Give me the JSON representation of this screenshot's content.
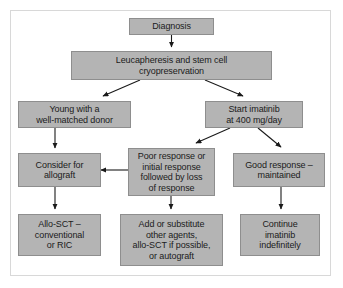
{
  "figure": {
    "type": "flowchart",
    "background_color": "#ffffff",
    "frame_color": "#d8d8d8",
    "node_fill": "#b4b4b4",
    "node_border": "#8e8e8e",
    "edge_color": "#1a1a1a",
    "text_color": "#1b1b1b"
  },
  "nodes": [
    {
      "id": "diagnosis",
      "label": "Diagnosis"
    },
    {
      "id": "leucapheresis",
      "label": "Leucapheresis and stem cell\ncryopreservation"
    },
    {
      "id": "young-donor",
      "label": "Young with a\nwell-matched donor"
    },
    {
      "id": "start-imatinib",
      "label": "Start imatinib\nat 400 mg/day"
    },
    {
      "id": "consider-allograft",
      "label": "Consider for\nallograft"
    },
    {
      "id": "poor-response",
      "label": "Poor response or\ninitial response\nfollowed by loss\nof response"
    },
    {
      "id": "good-response",
      "label": "Good response –\nmaintained"
    },
    {
      "id": "allo-sct",
      "label": "Allo-SCT –\nconventional\nor RIC"
    },
    {
      "id": "add-substitute",
      "label": "Add or substitute\nother agents,\nallo-SCT if possible,\nor autograft"
    },
    {
      "id": "continue-imatinib",
      "label": "Continue\nimatinib\nindefinitely"
    }
  ],
  "edges": [
    {
      "from": "diagnosis",
      "to": "leucapheresis",
      "kind": "vertical-down"
    },
    {
      "from": "leucapheresis",
      "to": "young-donor",
      "kind": "diagonal-down-left"
    },
    {
      "from": "leucapheresis",
      "to": "start-imatinib",
      "kind": "diagonal-down-right"
    },
    {
      "from": "young-donor",
      "to": "consider-allograft",
      "kind": "vertical-down"
    },
    {
      "from": "start-imatinib",
      "to": "poor-response",
      "kind": "diagonal-down-left"
    },
    {
      "from": "start-imatinib",
      "to": "good-response",
      "kind": "diagonal-down-right"
    },
    {
      "from": "poor-response",
      "to": "consider-allograft",
      "kind": "horizontal-left"
    },
    {
      "from": "consider-allograft",
      "to": "allo-sct",
      "kind": "vertical-down"
    },
    {
      "from": "poor-response",
      "to": "add-substitute",
      "kind": "vertical-down"
    },
    {
      "from": "good-response",
      "to": "continue-imatinib",
      "kind": "vertical-down"
    }
  ]
}
